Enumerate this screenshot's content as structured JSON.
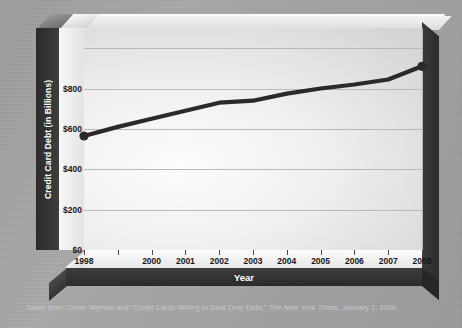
{
  "caption": {
    "prefix": "Taken from: Oliver Wyman and “Credit Cards Willing to Deal Over Debt,” ",
    "source": "The New York Times",
    "suffix": ", January 3, 2009."
  },
  "colors": {
    "line": "#2a2a2a",
    "panel_light": "#fdfdfd",
    "panel_dark": "#c9c9c9",
    "axis_bar": "#2b2b2b",
    "axis_text": "#ffffff",
    "tick_text": "#171717",
    "gridline": "#b9b9b9",
    "page_background": "#a3a3a3",
    "caption_text": "#c9c9c9"
  },
  "chart_data": {
    "type": "line",
    "title": "",
    "xlabel": "Year",
    "ylabel": "Credit Card Debt (in Billions)",
    "x": [
      1998,
      1999,
      2000,
      2001,
      2002,
      2003,
      2004,
      2005,
      2006,
      2007,
      2008
    ],
    "xticklabels": [
      "1998",
      "",
      "2000",
      "2001",
      "2002",
      "2003",
      "2004",
      "2005",
      "2006",
      "2007",
      "2008"
    ],
    "yticklabels": [
      "$0",
      "$200",
      "$400",
      "$600",
      "$800"
    ],
    "yticks": [
      0,
      200,
      400,
      600,
      800
    ],
    "ylim": [
      0,
      1100
    ],
    "xlim": [
      1998,
      2008
    ],
    "grid": true,
    "gridlines": [
      200,
      400,
      600,
      800,
      1000
    ],
    "legend": "none",
    "series": [
      {
        "name": "Credit Card Debt",
        "values": [
          565,
          610,
          650,
          690,
          730,
          740,
          775,
          800,
          820,
          845,
          910
        ]
      }
    ],
    "markers": {
      "start": {
        "x": 1998,
        "y": 565
      },
      "end": {
        "x": 2008,
        "y": 910
      }
    }
  }
}
